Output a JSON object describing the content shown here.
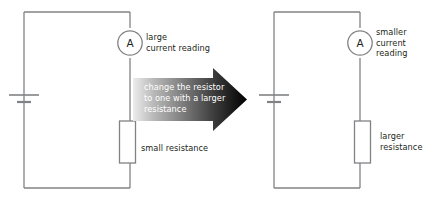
{
  "diagram": {
    "background_color": "#ffffff",
    "wire_color": "#808285",
    "text_color": "#231f20",
    "arrow_gradient_from": "#e8e8e8",
    "arrow_gradient_to": "#000000",
    "arrow_text_color": "#ffffff"
  },
  "left_circuit": {
    "name": "circuit-before",
    "ammeter_symbol": "A",
    "ammeter_label": "large\ncurrent reading",
    "resistor_label": "small resistance",
    "battery_symbol": "cell"
  },
  "arrow": {
    "text": "change the resistor\nto one with a larger\nresistance",
    "direction": "right"
  },
  "right_circuit": {
    "name": "circuit-after",
    "ammeter_symbol": "A",
    "ammeter_label": "smaller\ncurrent\nreading",
    "resistor_label": "larger\nresistance",
    "battery_symbol": "cell"
  }
}
